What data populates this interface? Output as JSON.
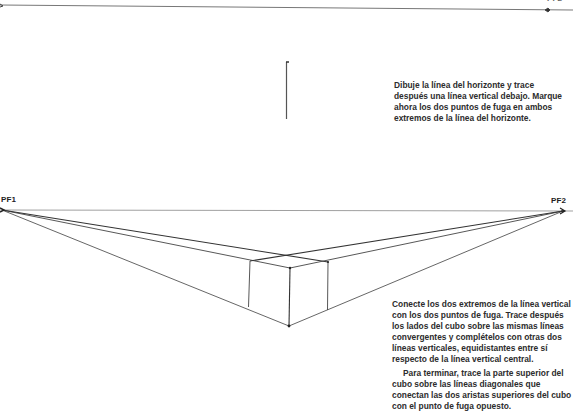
{
  "step1": {
    "top_label_partial": "PF2",
    "instruction": "Dibuje la línea del horizonte y trace después una línea vertical debajo. Marque ahora los dos puntos de fuga en ambos extremos de la línea del horizonte."
  },
  "step2": {
    "vanishing_point_left": "PF1",
    "vanishing_point_right": "PF2",
    "instruction_p1": "Conecte los dos extremos de la línea vertical con los dos puntos de fuga. Trace después los lados del cubo sobre las mismas líneas convergentes y complételos con otras dos líneas verticales, equidistantes entre sí respecto de la línea vertical central.",
    "instruction_p2": "Para terminar, trace la parte superior del cubo sobre las líneas diagonales que conectan las dos aristas superiores del cubo con el punto de fuga opuesto."
  },
  "colors": {
    "line": "#555555",
    "line_dark": "#333333",
    "text": "#2c2c2c"
  }
}
